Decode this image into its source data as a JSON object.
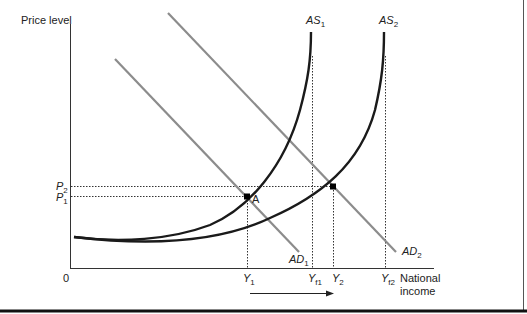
{
  "diagram": {
    "type": "aggregate-demand-aggregate-supply",
    "y_axis_label": "Price level",
    "x_axis_label_line1": "National",
    "x_axis_label_line2": "income",
    "origin_label": "0",
    "curves": {
      "as1": {
        "label": "AS",
        "sub": "1"
      },
      "as2": {
        "label": "AS",
        "sub": "2"
      },
      "ad1": {
        "label": "AD",
        "sub": "1"
      },
      "ad2": {
        "label": "AD",
        "sub": "2"
      }
    },
    "price_levels": {
      "p1": {
        "label": "P",
        "sub": "1"
      },
      "p2": {
        "label": "P",
        "sub": "2"
      }
    },
    "income_levels": {
      "y1": {
        "label": "Y",
        "sub": "1"
      },
      "yf1": {
        "label": "Y",
        "sub": "f1"
      },
      "y2": {
        "label": "Y",
        "sub": "2"
      },
      "yf2": {
        "label": "Y",
        "sub": "f2"
      }
    },
    "point_a_label": "A",
    "arrow_direction": "right",
    "colors": {
      "as_curve": "#1a1a1a",
      "ad_curve": "#8c8c8c",
      "axis": "#333333",
      "dotted": "#333333"
    }
  }
}
